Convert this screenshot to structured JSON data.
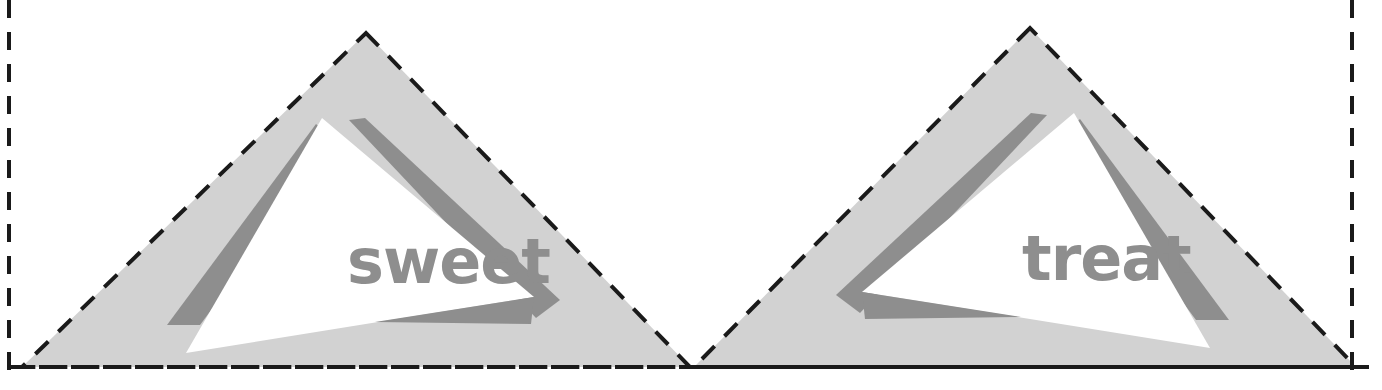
{
  "artboard": {
    "name": "sweet-treat-sticker-sheet",
    "width": 1382,
    "height": 390,
    "background_color": "#ffffff"
  },
  "cut_lines": {
    "name": "dashed-cut-guides",
    "color": "#1a1a1a",
    "stroke_width": 4,
    "dash_pattern": "18 14",
    "left_edge_x": 9,
    "right_edge_x": 1352,
    "bottom_edge_y": 367
  },
  "palette": {
    "outer_triangle": "#d2d2d2",
    "inner_triangle": "#ffffff",
    "accent_wedge": "#8e8e8e",
    "word_text": "#8e8e8e",
    "cut_line": "#1a1a1a",
    "page_background": "#ffffff"
  },
  "logos": [
    {
      "id": "sweet",
      "name": "sweet-triangle-logo",
      "word": "sweet",
      "orientation": "normal",
      "apex": {
        "x": 366,
        "y": 33
      },
      "bottom_left": {
        "x": 22,
        "y": 367
      },
      "bottom_right": {
        "x": 690,
        "y": 367
      },
      "word_position": {
        "x": 347,
        "y": 283
      }
    },
    {
      "id": "treat",
      "name": "treat-triangle-logo",
      "word": "treat",
      "orientation": "mirrored",
      "apex": {
        "x": 1030,
        "y": 28
      },
      "bottom_left": {
        "x": 694,
        "y": 367
      },
      "bottom_right": {
        "x": 1356,
        "y": 365
      },
      "word_position": {
        "x": 1022,
        "y": 280
      }
    }
  ],
  "shapes": {
    "outer_triangle_label": "light-gray-outer-triangle",
    "inner_triangle_label": "white-inner-triangle",
    "accent_top_label": "gray-accent-wedge-top",
    "accent_left_label": "gray-accent-wedge-left",
    "accent_bottom_label": "gray-accent-wedge-bottom"
  }
}
